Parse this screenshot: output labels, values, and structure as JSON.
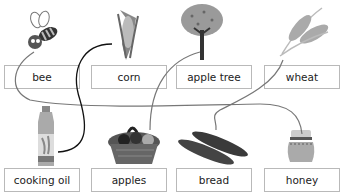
{
  "exercise": {
    "top_row": [
      {
        "label": "bee",
        "icon": "bee-icon"
      },
      {
        "label": "corn",
        "icon": "corn-icon"
      },
      {
        "label": "apple tree",
        "icon": "apple-tree-icon"
      },
      {
        "label": "wheat",
        "icon": "wheat-icon"
      }
    ],
    "bottom_row": [
      {
        "label": "cooking oil",
        "icon": "cooking-oil-icon"
      },
      {
        "label": "apples",
        "icon": "apple-basket-icon"
      },
      {
        "label": "bread",
        "icon": "bread-icon"
      },
      {
        "label": "honey",
        "icon": "honey-jar-icon"
      }
    ],
    "matches": [
      {
        "from": "bee",
        "to": "honey"
      },
      {
        "from": "corn",
        "to": "cooking oil"
      },
      {
        "from": "apple tree",
        "to": "apples"
      },
      {
        "from": "wheat",
        "to": "bread"
      }
    ]
  }
}
